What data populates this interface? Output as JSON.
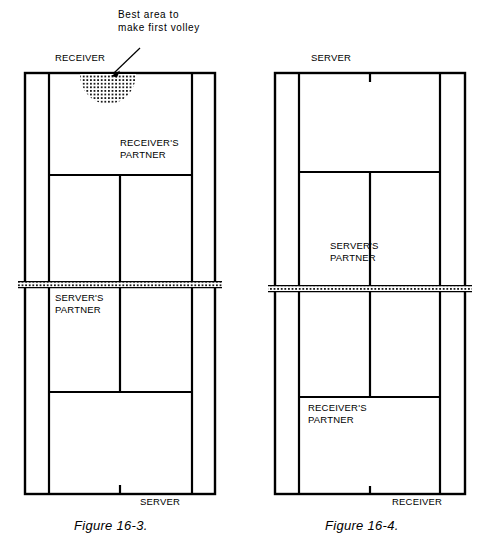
{
  "page": {
    "width": 484,
    "height": 548,
    "background": "#ffffff",
    "line_color": "#000000"
  },
  "annotation": {
    "text": "Best area to\nmake first volley",
    "arrow": {
      "from_x": 140,
      "from_y": 48,
      "to_x": 113,
      "to_y": 74
    }
  },
  "figures": [
    {
      "id": "figure-16-3",
      "caption": "Figure 16-3.",
      "court": {
        "left": 25,
        "right": 215,
        "top": 73,
        "bottom": 494,
        "singles_left": 49,
        "singles_right": 192,
        "net_y": 285,
        "service_line_near_y": 392,
        "service_line_far_y": 175,
        "center_x": 120
      },
      "labels": [
        {
          "name": "receiver",
          "text": "RECEIVER",
          "x": 55,
          "y": 57,
          "align": "left"
        },
        {
          "name": "receivers-partner",
          "text": "RECEIVER'S\nPARTNER",
          "x": 120,
          "y": 142,
          "align": "left"
        },
        {
          "name": "servers-partner",
          "text": "SERVER'S\nPARTNER",
          "x": 55,
          "y": 297,
          "align": "left"
        },
        {
          "name": "server",
          "text": "SERVER",
          "x": 140,
          "y": 500,
          "align": "left"
        }
      ],
      "shaded_area": {
        "name": "best-volley-area",
        "cx": 108,
        "cy": 74,
        "rx": 26,
        "ry": 30
      }
    },
    {
      "id": "figure-16-4",
      "caption": "Figure 16-4.",
      "court": {
        "left": 275,
        "right": 465,
        "top": 73,
        "bottom": 494,
        "singles_left": 299,
        "singles_right": 440,
        "net_y": 289,
        "service_line_near_y": 397,
        "service_line_far_y": 172,
        "center_x": 370
      },
      "labels": [
        {
          "name": "server",
          "text": "SERVER",
          "x": 311,
          "y": 57,
          "align": "left"
        },
        {
          "name": "servers-partner",
          "text": "SERVER'S\nPARTNER",
          "x": 330,
          "y": 245,
          "align": "left"
        },
        {
          "name": "receivers-partner",
          "text": "RECEIVER'S\nPARTNER",
          "x": 308,
          "y": 405,
          "align": "left"
        },
        {
          "name": "receiver",
          "text": "RECEIVER",
          "x": 392,
          "y": 500,
          "align": "left"
        }
      ]
    }
  ]
}
